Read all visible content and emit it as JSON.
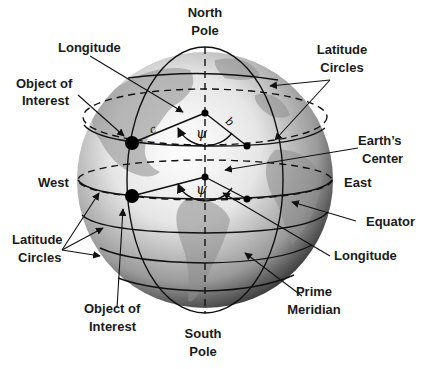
{
  "diagram": {
    "type": "globe-coordinate-diagram",
    "labels": {
      "north_pole": [
        "North",
        "Pole"
      ],
      "south_pole": [
        "South",
        "Pole"
      ],
      "longitude_top": "Longitude",
      "object_top": [
        "Object of",
        "Interest"
      ],
      "latitude_top": [
        "Latitude",
        "Circles"
      ],
      "earth_center": [
        "Earth’s",
        "Center"
      ],
      "west": "West",
      "east": "East",
      "equator": "Equator",
      "longitude_bottom": "Longitude",
      "latitude_bottom": [
        "Latitude",
        "Circles"
      ],
      "object_bottom": [
        "Object of",
        "Interest"
      ],
      "prime_meridian": [
        "Prime",
        "Meridian"
      ]
    },
    "symbols": {
      "angle_upper": "ψ",
      "angle_lower": "ψ",
      "vector_c": "c",
      "vector_b": "b"
    },
    "colors": {
      "line": "#111111",
      "globe_light": "#f4f4f4",
      "globe_dark": "#2a2a2a",
      "land": "#9a9a9a"
    }
  }
}
